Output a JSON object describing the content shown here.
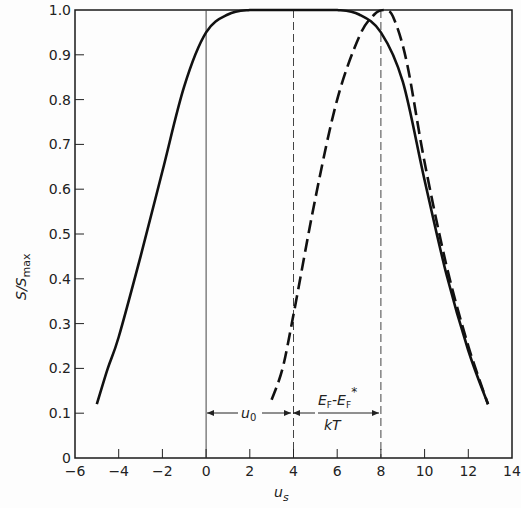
{
  "chart_data": {
    "type": "line",
    "title": "",
    "xlabel": "u_s",
    "ylabel": "S/S_max",
    "xlim": [
      -6,
      14
    ],
    "ylim": [
      0,
      1.0
    ],
    "grid": false,
    "legend": null,
    "x_ticks": [
      -6,
      -4,
      -2,
      0,
      2,
      4,
      6,
      8,
      10,
      12,
      14
    ],
    "x_tick_labels": [
      "-6",
      "-4",
      "-2",
      "0",
      "2",
      "4",
      "6",
      "8",
      "10",
      "12",
      "14"
    ],
    "y_ticks": [
      0,
      0.1,
      0.2,
      0.3,
      0.4,
      0.5,
      0.6,
      0.7,
      0.8,
      0.9,
      1.0
    ],
    "y_tick_labels": [
      "0",
      "0.1",
      "0.2",
      "0.3",
      "0.4",
      "0.5",
      "0.6",
      "0.7",
      "0.8",
      "0.9",
      "1.0"
    ],
    "series": [
      {
        "name": "solid",
        "style": "solid",
        "x": [
          -5,
          -4.5,
          -4,
          -3,
          -2,
          -1,
          0,
          1,
          2,
          3,
          4,
          5,
          6,
          7,
          8,
          9,
          10,
          11,
          12,
          12.9
        ],
        "y": [
          0.12,
          0.2,
          0.27,
          0.45,
          0.64,
          0.83,
          0.95,
          0.99,
          1.0,
          1.0,
          1.0,
          1.0,
          1.0,
          0.99,
          0.95,
          0.84,
          0.62,
          0.41,
          0.24,
          0.12
        ]
      },
      {
        "name": "dashed",
        "style": "dashed",
        "x": [
          3,
          3.5,
          4,
          5,
          6,
          7,
          7.7,
          8.2,
          8.6,
          9.2,
          10,
          11,
          12,
          12.9
        ],
        "y": [
          0.13,
          0.2,
          0.32,
          0.58,
          0.8,
          0.94,
          0.99,
          1.0,
          0.98,
          0.88,
          0.66,
          0.43,
          0.25,
          0.12
        ]
      }
    ],
    "reference_lines": [
      {
        "x": 0,
        "style": "solid-thin"
      },
      {
        "x": 4,
        "style": "dashed-thin"
      },
      {
        "x": 8,
        "style": "dashed-thin"
      }
    ],
    "annotations": [
      {
        "type": "double-arrow",
        "from_x": 0,
        "to_x": 4,
        "y": 0.1,
        "label": "u_0"
      },
      {
        "type": "double-arrow",
        "from_x": 4,
        "to_x": 8,
        "y": 0.1,
        "label": "(E_F - E_F*)/kT"
      }
    ]
  },
  "labels": {
    "ylabel_main": "S/S",
    "ylabel_sub": "max",
    "xlabel_main": "u",
    "xlabel_sub": "s",
    "ann1_main": "u",
    "ann1_sub": "0",
    "ann2_num_E1": "E",
    "ann2_num_sub1": "F",
    "ann2_num_minus": "-E",
    "ann2_num_sub2": "F",
    "ann2_num_star": "*",
    "ann2_den": "kT"
  }
}
